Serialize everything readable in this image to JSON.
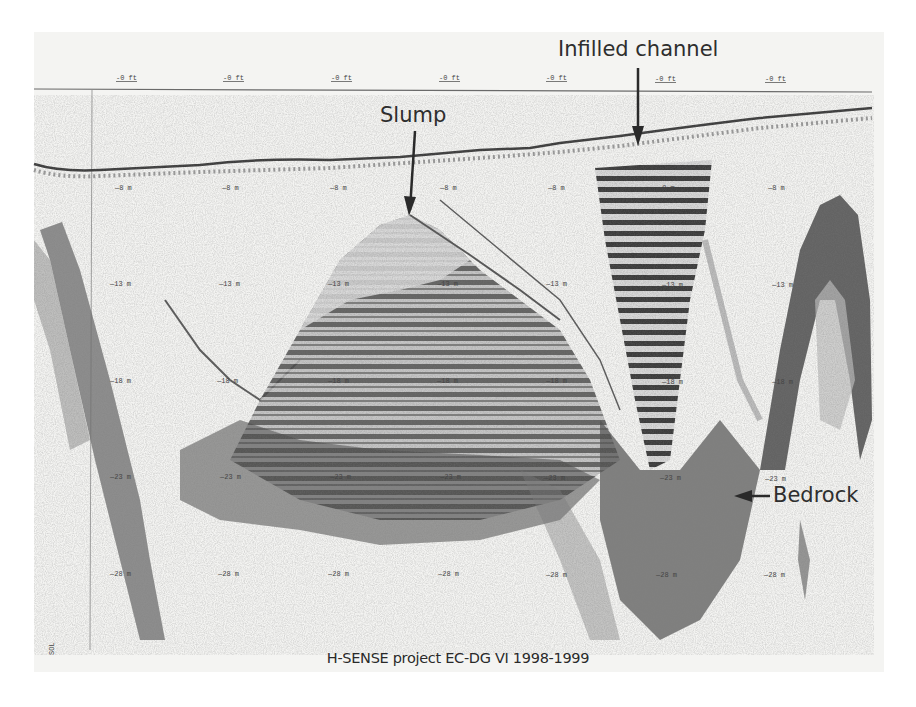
{
  "figure": {
    "type": "sub-bottom seismic profile",
    "annotations": {
      "slump": "Slump",
      "infilled_channel": "Infilled channel",
      "bedrock": "Bedrock"
    },
    "caption": "H-SENSE project EC-DG VI 1998-1999",
    "top_ruler_labels": [
      "-0 ft",
      "-0 ft",
      "-0 ft",
      "-0 ft",
      "-0 ft",
      "-0 ft",
      "-0 ft"
    ],
    "depth_rows": [
      {
        "label": "—8 m"
      },
      {
        "label": "—13 m"
      },
      {
        "label": "—18 m"
      },
      {
        "label": "—23 m"
      },
      {
        "label": "—28 m"
      }
    ],
    "side_mark": "SOL",
    "colors": {
      "background": "#f4f4f2",
      "reflector": "#3a3a3a",
      "text": "#2e2e2e"
    }
  }
}
